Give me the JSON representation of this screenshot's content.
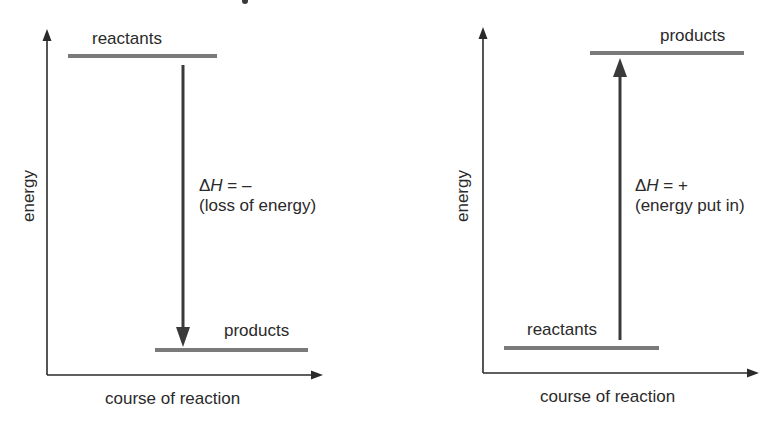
{
  "colors": {
    "axis": "#2a2a2a",
    "level_bar": "#7a7a7a",
    "arrow": "#3a3a3a",
    "text": "#2a2a2a",
    "background": "#ffffff"
  },
  "diagrams": [
    {
      "type": "exothermic",
      "y_axis_label": "energy",
      "x_axis_label": "course of reaction",
      "upper_level_label": "reactants",
      "lower_level_label": "products",
      "delta_h": {
        "symbol": "Δ",
        "variable": "H",
        "sign_text": " = –"
      },
      "description": "(loss of energy)",
      "arrow_direction": "down"
    },
    {
      "type": "endothermic",
      "y_axis_label": "energy",
      "x_axis_label": "course of reaction",
      "upper_level_label": "products",
      "lower_level_label": "reactants",
      "delta_h": {
        "symbol": "Δ",
        "variable": "H",
        "sign_text": " = +"
      },
      "description": "(energy put in)",
      "arrow_direction": "up"
    }
  ]
}
